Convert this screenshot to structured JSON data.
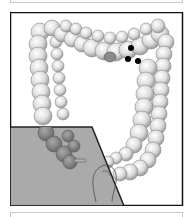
{
  "figure": {
    "frame_color": "#111111",
    "background_color": "#ffffff",
    "shaded_region_color": "#9e9e9e",
    "colon_color": "#d9d9d9",
    "lesion_color": "#8a8a8a",
    "marker_color": "#000000",
    "marker_count": 3,
    "lesion_count": 1
  }
}
